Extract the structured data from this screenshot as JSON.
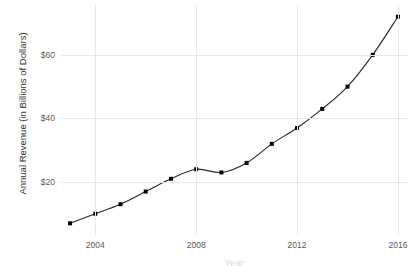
{
  "chart_data": {
    "type": "line",
    "title": "",
    "subtitle": "",
    "xlabel": "Year",
    "ylabel": "Annual Revenue (in Billions of Dollars)",
    "x": [
      2003,
      2004,
      2005,
      2006,
      2007,
      2008,
      2009,
      2010,
      2011,
      2012,
      2013,
      2014,
      2015,
      2016
    ],
    "values": [
      7,
      10,
      13,
      17,
      21,
      24,
      23,
      26,
      32,
      37,
      43,
      50,
      60,
      72
    ],
    "series": [
      {
        "name": "Annual Revenue",
        "values": [
          7,
          10,
          13,
          17,
          21,
          24,
          23,
          26,
          32,
          37,
          43,
          50,
          60,
          72
        ]
      }
    ],
    "xlim": [
      2002.6,
      2016.4
    ],
    "ylim": [
      3,
      76
    ],
    "x_ticks": [
      2004,
      2008,
      2012,
      2016
    ],
    "x_tick_labels": [
      "2004",
      "2008",
      "2012",
      "2016"
    ],
    "y_ticks": [
      20,
      40,
      60
    ],
    "y_tick_labels": [
      "$20",
      "$40",
      "$60"
    ],
    "grid": true,
    "grid_color": "#e8e8e8",
    "legend": false,
    "legend_position": "none",
    "line_color": "#262626",
    "marker_color": "#000000",
    "marker": "square",
    "background_color": "#ffffff",
    "text_color": "#5a5a5a"
  }
}
